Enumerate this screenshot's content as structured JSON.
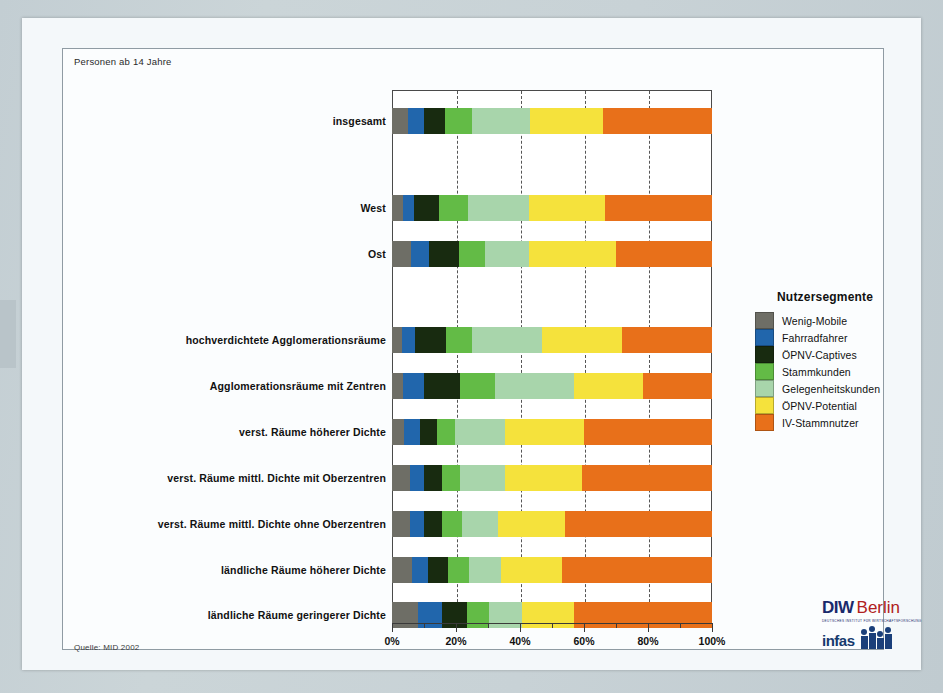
{
  "notes": {
    "top": "Personen ab 14 Jahre",
    "source": "Quelle: MID 2002"
  },
  "legend": {
    "title": "Nutzersegmente",
    "position": "right"
  },
  "logo": {
    "diw": "DIW",
    "berlin": "Berlin",
    "tagline": "DEUTSCHES INSTITUT FÜR WIRTSCHAFTSFORSCHUNG",
    "infas": "infas"
  },
  "chart_data": {
    "type": "bar",
    "orientation": "horizontal",
    "stacked": true,
    "stack_total": 100,
    "title": "",
    "subtitle": "Personen ab 14 Jahre",
    "xlabel": "",
    "ylabel": "",
    "xlim": [
      0,
      100
    ],
    "xticks": [
      0,
      20,
      40,
      60,
      80,
      100
    ],
    "xtick_labels": [
      "0%",
      "20%",
      "40%",
      "60%",
      "80%",
      "100%"
    ],
    "minor_xticks": [
      10,
      30,
      50,
      70,
      90
    ],
    "grid": true,
    "grid_axis": "x",
    "grid_style": "dashed",
    "legend_title": "Nutzersegmente",
    "series": [
      {
        "name": "Wenig-Mobile",
        "color": "#6e6e66",
        "values": [
          5.0,
          3.4,
          6.0,
          3.1,
          3.4,
          3.7,
          5.7,
          5.6,
          6.2,
          8.1
        ]
      },
      {
        "name": "Fahrradfahrer",
        "color": "#2166ac",
        "values": [
          5.0,
          3.5,
          5.6,
          4.2,
          6.5,
          5.2,
          4.2,
          4.4,
          5.0,
          7.5
        ]
      },
      {
        "name": "ÖPNV-Captives",
        "color": "#182b10",
        "values": [
          6.6,
          7.8,
          9.3,
          9.6,
          11.5,
          5.2,
          5.7,
          5.6,
          6.3,
          7.8
        ]
      },
      {
        "name": "Stammkunden",
        "color": "#63bb46",
        "values": [
          8.4,
          9.1,
          8.1,
          8.1,
          10.9,
          5.7,
          5.8,
          6.2,
          6.5,
          6.8
        ]
      },
      {
        "name": "Gelegenheitskunden",
        "color": "#a8d5ab",
        "values": [
          18.0,
          19.0,
          13.7,
          21.9,
          24.5,
          15.6,
          14.0,
          11.2,
          10.0,
          10.4
        ]
      },
      {
        "name": "ÖPNV-Potential",
        "color": "#f5e23c",
        "values": [
          23.0,
          23.8,
          27.3,
          25.0,
          21.8,
          24.5,
          24.0,
          21.0,
          19.0,
          16.3
        ]
      },
      {
        "name": "IV-Stammnutzer",
        "color": "#e8701a",
        "values": [
          34.0,
          33.4,
          30.0,
          28.1,
          21.4,
          40.1,
          40.6,
          46.0,
          47.0,
          43.1
        ]
      }
    ],
    "categories": [
      "insgesamt",
      "West",
      "Ost",
      "hochverdichtete Agglomerationsräume",
      "Agglomerationsräume mit  Zentren",
      "verst. Räume höherer Dichte",
      "verst. Räume mittl. Dichte mit Oberzentren",
      "verst. Räume mittl. Dichte ohne Oberzentren",
      "ländliche Räume höherer Dichte",
      "ländliche Räume geringerer Dichte"
    ],
    "category_rows": [
      {
        "label": "insgesamt",
        "top": 18
      },
      {
        "label": "West",
        "top": 105
      },
      {
        "label": "Ost",
        "top": 151
      },
      {
        "label": "hochverdichtete Agglomerationsräume",
        "top": 237
      },
      {
        "label": "Agglomerationsräume mit  Zentren",
        "top": 283
      },
      {
        "label": "verst. Räume höherer Dichte",
        "top": 329
      },
      {
        "label": "verst. Räume mittl. Dichte mit Oberzentren",
        "top": 375
      },
      {
        "label": "verst. Räume mittl. Dichte ohne Oberzentren",
        "top": 421
      },
      {
        "label": "ländliche Räume höherer Dichte",
        "top": 467
      },
      {
        "label": "ländliche Räume geringerer Dichte",
        "top": 512
      }
    ]
  }
}
